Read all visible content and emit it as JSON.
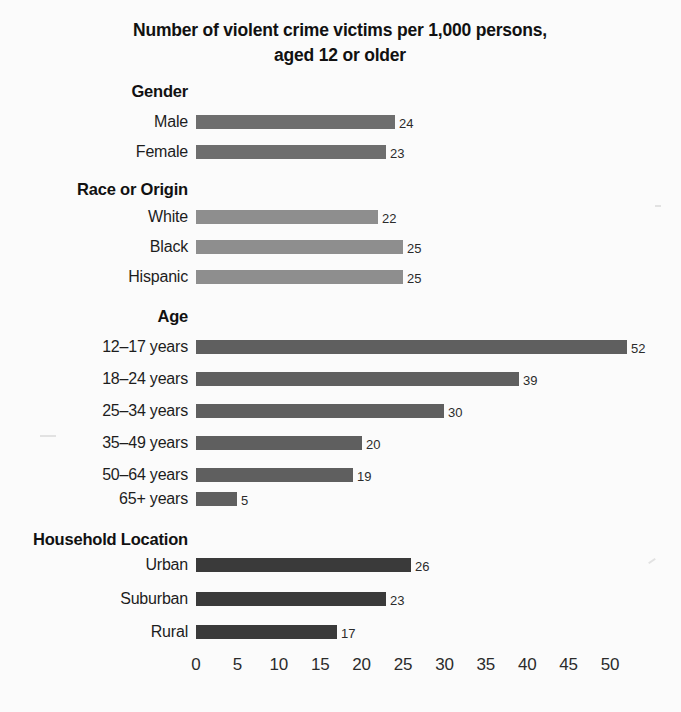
{
  "chart_data": {
    "type": "bar",
    "orientation": "horizontal",
    "title": "Number of violent crime victims per 1,000 persons, aged 12 or older",
    "title_lines": [
      "Number of violent crime victims per 1,000 persons,",
      "aged 12 or older"
    ],
    "xlabel": "",
    "ylabel": "",
    "xlim": [
      0,
      55
    ],
    "xticks": [
      0,
      5,
      10,
      15,
      20,
      25,
      30,
      35,
      40,
      45,
      50
    ],
    "xtick_labels": [
      "0",
      "5",
      "10",
      "15",
      "20",
      "25",
      "30",
      "35",
      "40",
      "45",
      "50"
    ],
    "grid": false,
    "legend": false,
    "value_labels": true,
    "groups": [
      {
        "name": "Gender",
        "color": "#6e6e6e",
        "categories": [
          "Male",
          "Female"
        ],
        "values": [
          24,
          23
        ]
      },
      {
        "name": "Race or Origin",
        "color": "#8e8e8e",
        "categories": [
          "White",
          "Black",
          "Hispanic"
        ],
        "values": [
          22,
          25,
          25
        ]
      },
      {
        "name": "Age",
        "color": "#5f5f5f",
        "categories": [
          "12–17 years",
          "18–24 years",
          "25–34 years",
          "35–49 years",
          "50–64 years",
          "65+ years"
        ],
        "values": [
          52,
          39,
          30,
          20,
          19,
          5
        ]
      },
      {
        "name": "Household Location",
        "color": "#3a3a3a",
        "categories": [
          "Urban",
          "Suburban",
          "Rural"
        ],
        "values": [
          26,
          23,
          17
        ]
      }
    ]
  },
  "layout": {
    "axis_origin_x": 196,
    "px_per_unit": 8.28,
    "label_right_edge": 188,
    "bar_height": 14,
    "groups": [
      {
        "header_y": 82,
        "row_ys": [
          115,
          145
        ]
      },
      {
        "header_y": 180,
        "row_ys": [
          210,
          240,
          270
        ]
      },
      {
        "header_y": 307,
        "row_ys": [
          340,
          372,
          404,
          436,
          468,
          492
        ]
      },
      {
        "header_y": 530,
        "row_ys": [
          558,
          592,
          625
        ]
      }
    ]
  }
}
